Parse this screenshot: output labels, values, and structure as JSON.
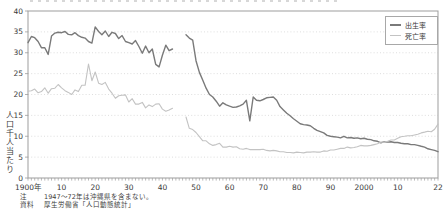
{
  "chart_data": {
    "type": "line",
    "title": "",
    "ylabel": "人口千人当たり",
    "x_start": 1900,
    "x_end": 2022,
    "ylim": [
      0,
      40
    ],
    "grid": "horizontal-dotted",
    "legend_position": "top-right",
    "data_gap_years": [
      1944,
      1946
    ],
    "y_ticks": [
      0,
      5,
      10,
      15,
      20,
      25,
      30,
      35,
      40
    ],
    "x_ticks": [
      {
        "label": "1900年",
        "year": 1900
      },
      {
        "label": "10",
        "year": 1910
      },
      {
        "label": "20",
        "year": 1920
      },
      {
        "label": "30",
        "year": 1930
      },
      {
        "label": "40",
        "year": 1940
      },
      {
        "label": "50",
        "year": 1950
      },
      {
        "label": "60",
        "year": 1960
      },
      {
        "label": "70",
        "year": 1970
      },
      {
        "label": "80",
        "year": 1980
      },
      {
        "label": "90",
        "year": 1990
      },
      {
        "label": "2000",
        "year": 2000
      },
      {
        "label": "10",
        "year": 2010
      },
      {
        "label": "22",
        "year": 2022
      }
    ],
    "series": [
      {
        "name": "出生率",
        "color": "#7a7a7a",
        "width": 1.4,
        "values": [
          32.4,
          33.9,
          33.6,
          32.7,
          31.2,
          31.2,
          29.6,
          34.0,
          34.7,
          34.9,
          34.8,
          35.1,
          34.4,
          34.3,
          34.8,
          34.1,
          33.7,
          33.5,
          32.7,
          32.3,
          36.2,
          35.1,
          34.3,
          35.2,
          33.9,
          34.9,
          34.6,
          33.4,
          34.1,
          32.7,
          32.4,
          32.1,
          32.9,
          31.5,
          29.9,
          31.6,
          30.0,
          30.9,
          27.2,
          26.6,
          29.4,
          31.8,
          30.5,
          30.9,
          null,
          null,
          null,
          34.3,
          33.5,
          33.0,
          28.1,
          25.3,
          23.4,
          21.5,
          20.0,
          19.4,
          18.4,
          17.2,
          18.0,
          17.5,
          17.2,
          16.9,
          17.0,
          17.3,
          17.7,
          18.6,
          13.7,
          19.4,
          18.6,
          18.5,
          18.8,
          19.2,
          19.3,
          19.4,
          18.6,
          17.1,
          16.3,
          15.5,
          14.9,
          14.2,
          13.6,
          13.0,
          12.8,
          12.7,
          12.5,
          11.9,
          11.4,
          11.1,
          10.8,
          10.2,
          10.0,
          9.9,
          9.8,
          9.6,
          10.0,
          9.6,
          9.7,
          9.5,
          9.6,
          9.4,
          9.5,
          9.3,
          9.2,
          8.9,
          8.8,
          8.4,
          8.7,
          8.6,
          8.7,
          8.5,
          8.5,
          8.3,
          8.2,
          8.2,
          8.0,
          8.0,
          7.8,
          7.6,
          7.4,
          7.0,
          6.8,
          6.6,
          6.3
        ]
      },
      {
        "name": "死亡率",
        "color": "#c3c3c3",
        "width": 1.1,
        "values": [
          20.8,
          20.9,
          21.3,
          20.4,
          20.7,
          21.6,
          20.3,
          21.4,
          21.5,
          22.4,
          21.6,
          20.9,
          20.5,
          20.0,
          21.1,
          20.7,
          22.2,
          22.2,
          27.3,
          23.3,
          25.4,
          22.7,
          22.4,
          22.9,
          21.3,
          20.3,
          19.1,
          19.7,
          19.8,
          19.9,
          18.2,
          19.0,
          17.7,
          17.7,
          18.1,
          16.8,
          17.5,
          17.1,
          17.7,
          17.8,
          16.5,
          16.0,
          16.3,
          16.7,
          null,
          null,
          null,
          14.6,
          11.9,
          11.6,
          10.9,
          9.9,
          8.9,
          8.9,
          8.2,
          7.8,
          8.0,
          8.3,
          7.4,
          7.4,
          7.6,
          7.4,
          7.5,
          7.0,
          6.9,
          7.1,
          6.8,
          6.8,
          6.8,
          6.8,
          6.9,
          6.6,
          6.5,
          6.6,
          6.5,
          6.3,
          6.3,
          6.1,
          6.1,
          6.0,
          6.2,
          6.1,
          6.0,
          6.2,
          6.2,
          6.3,
          6.2,
          6.2,
          6.5,
          6.4,
          6.7,
          6.7,
          6.9,
          7.1,
          7.1,
          7.4,
          7.2,
          7.3,
          7.5,
          7.8,
          7.7,
          7.7,
          7.8,
          8.0,
          8.2,
          8.6,
          8.6,
          8.8,
          9.1,
          9.1,
          9.5,
          9.9,
          10.0,
          10.1,
          10.1,
          10.3,
          10.5,
          10.8,
          11.0,
          11.2,
          11.1,
          11.7,
          12.9
        ]
      }
    ],
    "colors": {
      "frame": "#9d9d9d",
      "gridline": "#d6d6d6",
      "tick": "#9d9d9d",
      "text": "#3a3a3a"
    }
  },
  "legend": {
    "items": [
      {
        "label": "出生率"
      },
      {
        "label": "死亡率"
      }
    ]
  },
  "notes": {
    "note_label": "注",
    "note_text": "1947〜72年は沖縄県を含まない。",
    "source_label": "資料",
    "source_text": "厚生労働省「人口動態統計」"
  }
}
